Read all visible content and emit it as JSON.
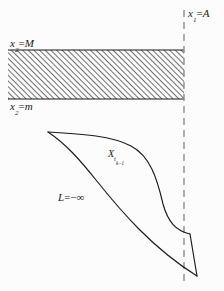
{
  "figure": {
    "domain": "mathematical-diagram",
    "background_color": "#fcfcfc",
    "ink_color": "#1a1a1a",
    "width": 224,
    "height": 291
  },
  "labels": {
    "vertical_line": {
      "var": "x",
      "sub": "1",
      "eq": "=",
      "value": "A"
    },
    "strip_top": {
      "var": "x",
      "sub": "2",
      "eq": "=",
      "value": "M"
    },
    "strip_bottom": {
      "var": "x",
      "sub": "2",
      "eq": "=",
      "value": "m"
    },
    "region": {
      "var": "X",
      "sub": "t",
      "subsub": "k−1"
    },
    "lower_bound": {
      "var": "L",
      "eq": "=",
      "value": "−∞"
    }
  },
  "elements": {
    "hatched_strip": {
      "name": "hatched-band",
      "x": 8,
      "y": 50,
      "width": 176,
      "height": 49,
      "hatch_angle_deg": 45,
      "hatch_spacing_px": 4,
      "stroke_color": "#1a1a1a"
    },
    "dashed_line": {
      "name": "vertical-dashed-line",
      "x": 184,
      "y_start": 10,
      "y_end": 286,
      "dash_pattern": "7 5",
      "color": "#8c8c8c"
    },
    "lens_region": {
      "name": "curved-region",
      "cusp_point": [
        48,
        132
      ],
      "closure_top": [
        190,
        234
      ],
      "closure_bottom": [
        197,
        276
      ],
      "stroke_color": "#1a1a1a",
      "fill": "none"
    }
  }
}
